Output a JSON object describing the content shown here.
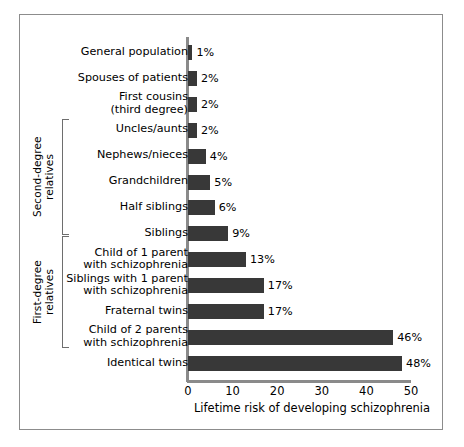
{
  "chart_data": {
    "type": "bar",
    "orientation": "horizontal",
    "title": "",
    "xlabel": "Lifetime risk of developing schizophrenia",
    "ylabel": "",
    "xlim": [
      0,
      50
    ],
    "xticks": [
      0,
      10,
      20,
      30,
      40,
      50
    ],
    "xtick_labels": [
      "0",
      "10",
      "20",
      "30",
      "40",
      "50"
    ],
    "grid": false,
    "legend": false,
    "bar_color": "#383838",
    "axis_color": "#8a8a8a",
    "value_suffix": "%",
    "categories": [
      "General population",
      "Spouses of patients",
      "First cousins\n(third degree)",
      "Uncles/aunts",
      "Nephews/nieces",
      "Grandchildren",
      "Half siblings",
      "Siblings",
      "Child of 1 parent\nwith schizophrenia",
      "Siblings with 1 parent\nwith schizophrenia",
      "Fraternal twins",
      "Child of 2 parents\nwith schizophrenia",
      "Identical twins"
    ],
    "values": [
      1,
      2,
      2,
      2,
      4,
      5,
      6,
      9,
      13,
      17,
      17,
      46,
      48
    ],
    "value_labels": [
      "1%",
      "2%",
      "2%",
      "2%",
      "4%",
      "5%",
      "6%",
      "9%",
      "13%",
      "17%",
      "17%",
      "46%",
      "48%"
    ],
    "groups": [
      {
        "label": "Second-degree\nrelatives",
        "from_index": 3,
        "to_index": 6
      },
      {
        "label": "First-degree\nrelatives",
        "from_index": 7,
        "to_index": 10
      }
    ]
  }
}
